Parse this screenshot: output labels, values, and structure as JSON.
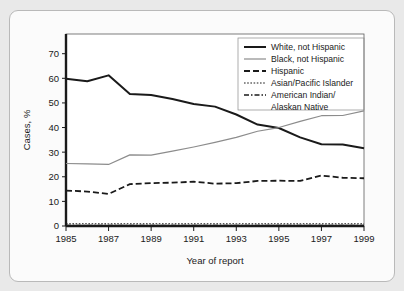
{
  "figure": {
    "background_color": "#e9e9e9",
    "card_color": "#fbfbfb"
  },
  "chart_data": {
    "type": "line",
    "title": "",
    "xlabel": "Year of report",
    "ylabel": "Cases, %",
    "x": [
      1985,
      1986,
      1987,
      1988,
      1989,
      1990,
      1991,
      1992,
      1993,
      1994,
      1995,
      1996,
      1997,
      1998,
      1999
    ],
    "xlim": [
      1985,
      1999
    ],
    "ylim": [
      0,
      78
    ],
    "xticks": [
      1985,
      1987,
      1989,
      1991,
      1993,
      1995,
      1997,
      1999
    ],
    "xtick_labels": [
      "1985",
      "1987",
      "1989",
      "1991",
      "1993",
      "1995",
      "1997",
      "1999"
    ],
    "yticks": [
      0,
      10,
      20,
      30,
      40,
      50,
      60,
      70
    ],
    "ytick_labels": [
      "0",
      "10",
      "20",
      "30",
      "40",
      "50",
      "60",
      "70"
    ],
    "grid": false,
    "legend_position": "upper right",
    "series": [
      {
        "name": "White, not Hispanic",
        "color": "#1a1a1a",
        "style": "solid",
        "width": 2.0,
        "dash": "",
        "values": [
          59.8,
          58.8,
          61.2,
          53.6,
          53.2,
          51.6,
          49.6,
          48.5,
          45.3,
          41.2,
          39.8,
          36.0,
          33.2,
          33.1,
          31.6
        ]
      },
      {
        "name": "Black, not Hispanic",
        "color": "#8c8c8c",
        "style": "solid",
        "width": 1.2,
        "dash": "",
        "values": [
          25.4,
          25.2,
          25.0,
          28.9,
          28.8,
          30.4,
          32.1,
          34.0,
          36.0,
          38.5,
          40.0,
          42.5,
          44.8,
          44.9,
          46.8
        ]
      },
      {
        "name": "Hispanic",
        "color": "#1a1a1a",
        "style": "dashed",
        "width": 1.8,
        "dash": "6,3",
        "values": [
          14.4,
          14.0,
          13.0,
          17.0,
          17.4,
          17.6,
          18.0,
          17.2,
          17.4,
          18.3,
          18.4,
          18.3,
          20.5,
          19.6,
          19.4
        ]
      },
      {
        "name": "Asian/Pacific Islander",
        "color": "#1a1a1a",
        "style": "dotted",
        "width": 1.0,
        "dash": "1.6,1.6",
        "values": [
          0.9,
          0.9,
          0.9,
          0.9,
          0.9,
          0.9,
          0.9,
          0.9,
          0.9,
          0.9,
          0.9,
          0.9,
          0.9,
          0.9,
          0.9
        ]
      },
      {
        "name": "American Indian/\nAlaskan Native",
        "color": "#1a1a1a",
        "style": "dashdot",
        "width": 1.4,
        "dash": "5,2,1.5,2",
        "values": [
          0.2,
          0.2,
          0.2,
          0.2,
          0.2,
          0.2,
          0.2,
          0.2,
          0.2,
          0.2,
          0.2,
          0.2,
          0.2,
          0.2,
          0.2
        ]
      }
    ],
    "legend_entries": [
      {
        "label": "White, not Hispanic",
        "label2": ""
      },
      {
        "label": "Black, not Hispanic",
        "label2": ""
      },
      {
        "label": "Hispanic",
        "label2": ""
      },
      {
        "label": "Asian/Pacific Islander",
        "label2": ""
      },
      {
        "label": "American Indian/",
        "label2": "Alaskan Native"
      }
    ]
  }
}
